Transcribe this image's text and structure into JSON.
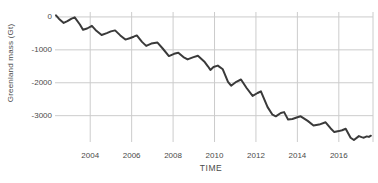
{
  "chart": {
    "xlabel": "TIME",
    "ylabel": "Greenland mass (Gt)"
  },
  "chart_data": {
    "type": "line",
    "title": "",
    "xlabel": "TIME",
    "ylabel": "Greenland mass (Gt)",
    "xlim": [
      2002.3,
      2017.65
    ],
    "ylim": [
      -3800,
      150
    ],
    "grid": true,
    "legend": false,
    "line_color": "#3a3a3a",
    "grid_color": "#cccccc",
    "text_color": "#4a4a4a",
    "x_ticks": [
      {
        "label": "2004",
        "t": 2004
      },
      {
        "label": "2006",
        "t": 2006
      },
      {
        "label": "2008",
        "t": 2008
      },
      {
        "label": "2010",
        "t": 2010
      },
      {
        "label": "2012",
        "t": 2012
      },
      {
        "label": "2014",
        "t": 2014
      },
      {
        "label": "2016",
        "t": 2016
      }
    ],
    "y_ticks": [
      {
        "label": "0",
        "v": 0
      },
      {
        "label": "-1000",
        "v": -1000
      },
      {
        "label": "-2000",
        "v": -2000
      },
      {
        "label": "-3000",
        "v": -3000
      }
    ],
    "series": [
      {
        "name": "Greenland mass (Gt)",
        "points": [
          [
            2002.35,
            50
          ],
          [
            2002.5,
            -60
          ],
          [
            2002.72,
            -180
          ],
          [
            2002.9,
            -130
          ],
          [
            2003.1,
            -50
          ],
          [
            2003.25,
            -10
          ],
          [
            2003.5,
            -230
          ],
          [
            2003.65,
            -390
          ],
          [
            2003.85,
            -350
          ],
          [
            2004.08,
            -270
          ],
          [
            2004.3,
            -420
          ],
          [
            2004.55,
            -550
          ],
          [
            2004.8,
            -490
          ],
          [
            2005.0,
            -440
          ],
          [
            2005.2,
            -410
          ],
          [
            2005.45,
            -560
          ],
          [
            2005.7,
            -690
          ],
          [
            2005.9,
            -650
          ],
          [
            2006.1,
            -600
          ],
          [
            2006.25,
            -560
          ],
          [
            2006.5,
            -760
          ],
          [
            2006.7,
            -880
          ],
          [
            2006.95,
            -810
          ],
          [
            2007.25,
            -780
          ],
          [
            2007.5,
            -960
          ],
          [
            2007.8,
            -1190
          ],
          [
            2008.05,
            -1120
          ],
          [
            2008.25,
            -1090
          ],
          [
            2008.5,
            -1220
          ],
          [
            2008.7,
            -1290
          ],
          [
            2008.95,
            -1230
          ],
          [
            2009.2,
            -1180
          ],
          [
            2009.5,
            -1350
          ],
          [
            2009.68,
            -1500
          ],
          [
            2009.8,
            -1610
          ],
          [
            2009.95,
            -1520
          ],
          [
            2010.16,
            -1480
          ],
          [
            2010.4,
            -1590
          ],
          [
            2010.65,
            -1970
          ],
          [
            2010.8,
            -2090
          ],
          [
            2011.05,
            -1970
          ],
          [
            2011.28,
            -1900
          ],
          [
            2011.55,
            -2160
          ],
          [
            2011.84,
            -2400
          ],
          [
            2012.08,
            -2310
          ],
          [
            2012.24,
            -2260
          ],
          [
            2012.56,
            -2740
          ],
          [
            2012.8,
            -2970
          ],
          [
            2012.96,
            -3020
          ],
          [
            2013.2,
            -2920
          ],
          [
            2013.36,
            -2890
          ],
          [
            2013.55,
            -3120
          ],
          [
            2013.76,
            -3100
          ],
          [
            2014.0,
            -3050
          ],
          [
            2014.16,
            -3020
          ],
          [
            2014.5,
            -3160
          ],
          [
            2014.78,
            -3300
          ],
          [
            2015.05,
            -3270
          ],
          [
            2015.36,
            -3200
          ],
          [
            2015.6,
            -3380
          ],
          [
            2015.78,
            -3500
          ],
          [
            2016.0,
            -3470
          ],
          [
            2016.16,
            -3440
          ],
          [
            2016.33,
            -3400
          ],
          [
            2016.57,
            -3670
          ],
          [
            2016.73,
            -3740
          ],
          [
            2016.97,
            -3620
          ],
          [
            2017.1,
            -3650
          ],
          [
            2017.21,
            -3670
          ],
          [
            2017.35,
            -3630
          ],
          [
            2017.45,
            -3645
          ],
          [
            2017.55,
            -3610
          ]
        ]
      }
    ]
  }
}
